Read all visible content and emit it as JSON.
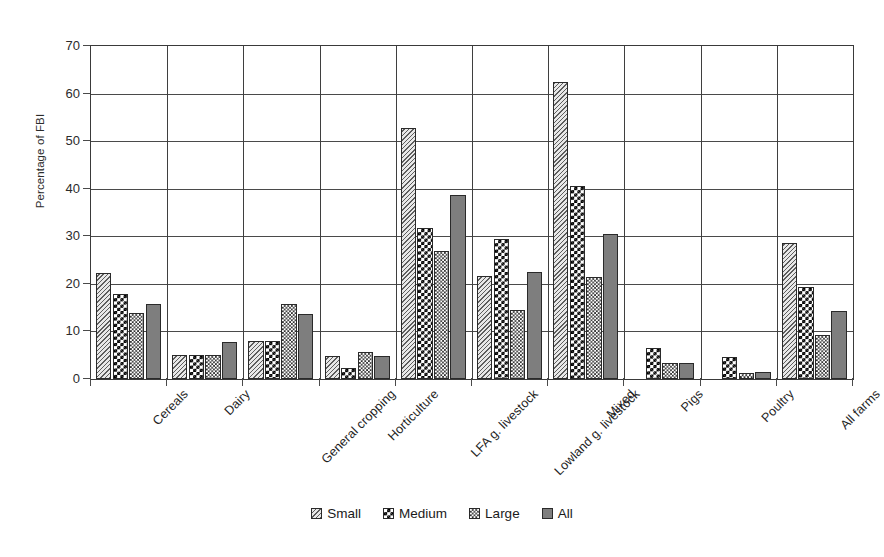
{
  "chart_data": {
    "type": "bar",
    "title": "",
    "xlabel": "",
    "ylabel": "Percentage of FBI",
    "ylim": [
      0,
      70
    ],
    "yticks": [
      0,
      10,
      20,
      30,
      40,
      50,
      60,
      70
    ],
    "grid": "horizontal-and-vertical",
    "legend_position": "bottom-center",
    "categories": [
      "Cereals",
      "Dairy",
      "General cropping",
      "Horticulture",
      "LFA g. livestock",
      "Lowland g. livestock",
      "Mixed",
      "Pigs",
      "Poultry",
      "All farms"
    ],
    "series": [
      {
        "name": "Small",
        "pattern": "diagonal-hatch",
        "values": [
          22.2,
          5.0,
          7.9,
          4.9,
          52.7,
          21.7,
          62.5,
          null,
          null,
          28.5
        ]
      },
      {
        "name": "Medium",
        "pattern": "checkerboard",
        "values": [
          17.9,
          5.0,
          7.9,
          2.4,
          31.8,
          29.5,
          40.5,
          6.5,
          4.6,
          19.3
        ]
      },
      {
        "name": "Large",
        "pattern": "fine-dots",
        "values": [
          13.9,
          5.0,
          15.8,
          5.6,
          26.9,
          14.5,
          21.5,
          3.3,
          1.3,
          9.2
        ]
      },
      {
        "name": "All",
        "pattern": "solid-gray",
        "values": [
          15.8,
          7.8,
          13.7,
          4.8,
          38.7,
          22.5,
          30.5,
          3.4,
          1.4,
          14.3
        ]
      }
    ]
  },
  "colors": {
    "small": "#c9c9c9",
    "medium": "#000000",
    "large": "#2f2f2f",
    "all": "#7e7e7e",
    "axis": "#3a3a3a",
    "grid": "#4a4a4a",
    "text": "#1a1a1a"
  }
}
